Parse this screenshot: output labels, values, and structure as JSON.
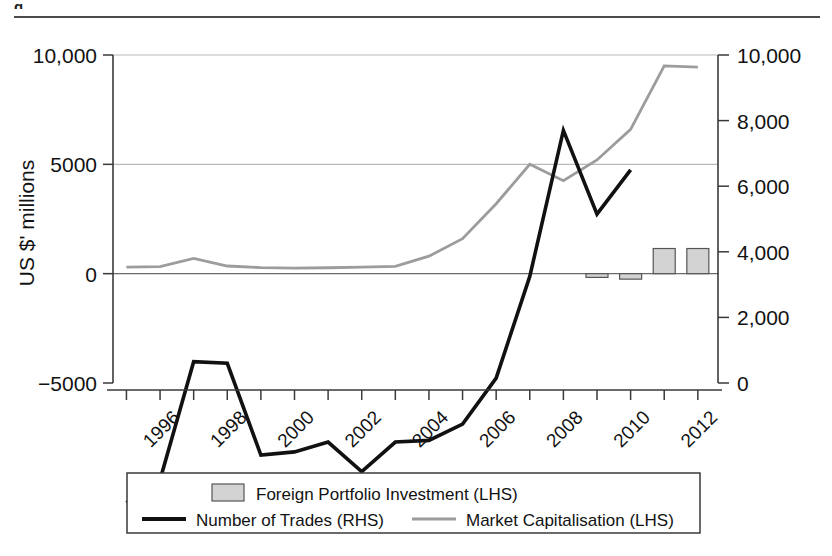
{
  "figure": {
    "header_fragment": "g",
    "width": 832,
    "height": 556
  },
  "chart_data": {
    "type": "line",
    "title": "",
    "subtitle": "",
    "xlabel": "",
    "ylabel": "US $' millions",
    "y2label": "",
    "grid": true,
    "legend_position": "bottom",
    "x": [
      1995,
      1996,
      1997,
      1998,
      1999,
      2000,
      2001,
      2002,
      2003,
      2004,
      2005,
      2006,
      2007,
      2008,
      2009,
      2010,
      2011,
      2012
    ],
    "tick_labels": [
      "1996",
      "1998",
      "2000",
      "2002",
      "2004",
      "2006",
      "2008",
      "2010",
      "2012"
    ],
    "tick_values": [
      1996,
      1998,
      2000,
      2002,
      2004,
      2006,
      2008,
      2010,
      2012
    ],
    "ylim": [
      -5000,
      10000
    ],
    "yticks": [
      -5000,
      0,
      5000,
      10000
    ],
    "ytick_labels": [
      "−5000",
      "0",
      "5000",
      "10,000"
    ],
    "y2lim": [
      0,
      10000
    ],
    "y2ticks": [
      0,
      2000,
      4000,
      6000,
      8000,
      10000
    ],
    "y2tick_labels": [
      "0",
      "2,000",
      "4,000",
      "6,000",
      "8,000",
      "10,000"
    ],
    "series": [
      {
        "name": "Number of Trades (RHS)",
        "key": "trades",
        "type": "line",
        "axis": "right",
        "color": "#111111",
        "x": [
          1995,
          1996,
          1997,
          1998,
          1999,
          2000,
          2001,
          2002,
          2003,
          2004,
          2005,
          2006,
          2007,
          2008,
          2009,
          2010
        ],
        "values": [
          -3650,
          -2950,
          650,
          600,
          -2200,
          -2100,
          -1800,
          -2700,
          -1800,
          -1750,
          -1250,
          150,
          3250,
          7700,
          5150,
          6500
        ]
      },
      {
        "name": "Market Capitalisation (LHS)",
        "key": "market_cap",
        "type": "line",
        "axis": "left",
        "color": "#9c9c9c",
        "x": [
          1995,
          1996,
          1997,
          1998,
          1999,
          2000,
          2001,
          2002,
          2003,
          2004,
          2005,
          2006,
          2007,
          2008,
          2009,
          2010,
          2011,
          2012
        ],
        "values": [
          300,
          320,
          700,
          350,
          280,
          250,
          270,
          300,
          330,
          800,
          1600,
          3200,
          5000,
          4250,
          5200,
          6600,
          9500,
          9450
        ]
      },
      {
        "name": "Foreign Portfolio Investment (LHS)",
        "key": "fpi",
        "type": "bar",
        "axis": "left",
        "color": "#d3d3d3",
        "x": [
          2009,
          2010,
          2011,
          2012
        ],
        "values": [
          -170,
          -250,
          1150,
          1150
        ]
      }
    ],
    "legend": [
      {
        "label": "Foreign Portfolio Investment (LHS)",
        "marker": "bar",
        "color": "#d3d3d3"
      },
      {
        "label": "Number of Trades (RHS)",
        "marker": "line",
        "color": "#111111"
      },
      {
        "label": "Market Capitalisation (LHS)",
        "marker": "line",
        "color": "#9c9c9c"
      }
    ]
  }
}
